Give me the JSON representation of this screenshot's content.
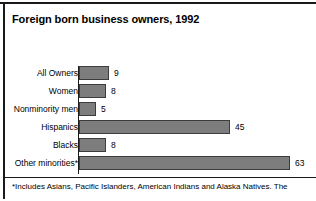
{
  "chart_data": {
    "type": "bar",
    "orientation": "horizontal",
    "title": "Foreign born business owners, 1992",
    "xlabel": "",
    "ylabel": "",
    "categories": [
      "All Owners",
      "Women",
      "Nonminority men",
      "Hispanics",
      "Blacks",
      "Other minorities*"
    ],
    "values": [
      9,
      8,
      5,
      45,
      8,
      63
    ],
    "value_labels": [
      "9",
      "8",
      "5",
      "45",
      "8",
      "63"
    ],
    "xlim": [
      0,
      70
    ],
    "grid": false,
    "legend": null,
    "bar_color": "#7d7d7d",
    "bar_edge_color": "#3d3d3d",
    "footnote": "*Includes Asians, Pacific Islanders, American Indians and Alaska Natives.  The"
  },
  "figure": {
    "background": "#ffffff",
    "rule_color": "#1a1a1a"
  }
}
